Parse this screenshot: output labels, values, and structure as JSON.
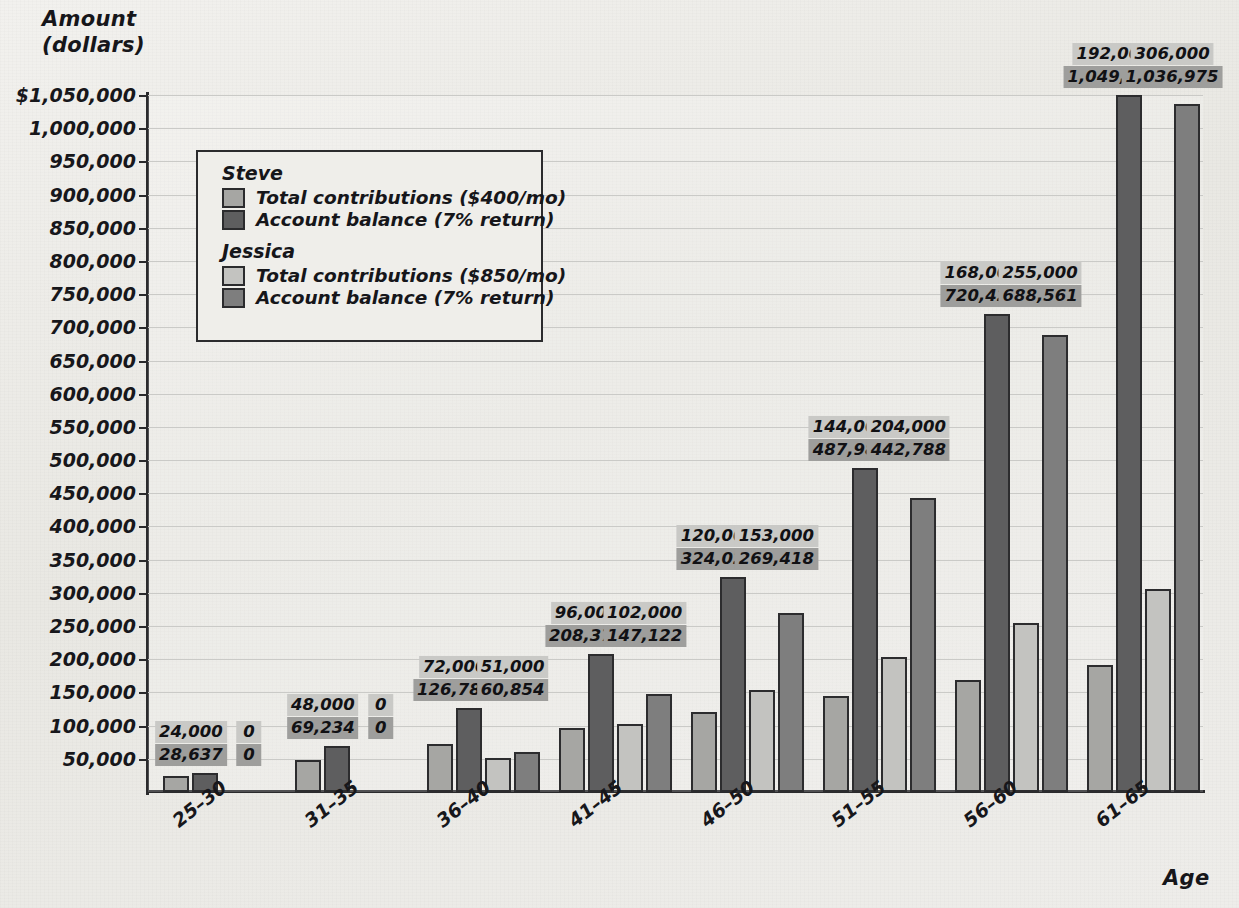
{
  "chart_data": {
    "type": "bar",
    "title": "",
    "xlabel": "Age",
    "ylabel": "Amount (dollars)",
    "ylabel_line1": "Amount",
    "ylabel_line2": "(dollars)",
    "ylim": [
      0,
      1050000
    ],
    "grid": true,
    "legend_position": "upper-left-inside",
    "categories": [
      "25–30",
      "31–35",
      "36–40",
      "41–45",
      "46–50",
      "51–55",
      "56–60",
      "61–65"
    ],
    "y_ticks": [
      "$1,050,000",
      "1,000,000",
      "950,000",
      "900,000",
      "850,000",
      "800,000",
      "750,000",
      "700,000",
      "650,000",
      "600,000",
      "550,000",
      "500,000",
      "450,000",
      "400,000",
      "350,000",
      "300,000",
      "250,000",
      "200,000",
      "150,000",
      "100,000",
      "50,000"
    ],
    "y_tick_values": [
      1050000,
      1000000,
      950000,
      900000,
      850000,
      800000,
      750000,
      700000,
      650000,
      600000,
      550000,
      500000,
      450000,
      400000,
      350000,
      300000,
      250000,
      200000,
      150000,
      100000,
      50000
    ],
    "series": [
      {
        "name": "Steve Total contributions ($400/mo)",
        "person": "Steve",
        "key": "s-contrib",
        "color": "#a6a6a3",
        "values": [
          24000,
          48000,
          72000,
          96000,
          120000,
          144000,
          168000,
          192000
        ],
        "labels": [
          "24,000",
          "48,000",
          "72,000",
          "96,000",
          "120,000",
          "144,000",
          "168,000",
          "192,000"
        ]
      },
      {
        "name": "Steve Account balance (7% return)",
        "person": "Steve",
        "key": "s-balance",
        "color": "#5e5e5f",
        "values": [
          28637,
          69234,
          126785,
          208371,
          324029,
          487988,
          720422,
          1049925
        ],
        "labels": [
          "28,637",
          "69,234",
          "126,785",
          "208,371",
          "324,029",
          "487,988",
          "720,422",
          "1,049,925"
        ]
      },
      {
        "name": "Jessica Total contributions ($850/mo)",
        "person": "Jessica",
        "key": "j-contrib",
        "color": "#c3c3c0",
        "values": [
          0,
          0,
          51000,
          102000,
          153000,
          204000,
          255000,
          306000
        ],
        "labels": [
          "0",
          "0",
          "51,000",
          "102,000",
          "153,000",
          "204,000",
          "255,000",
          "306,000"
        ]
      },
      {
        "name": "Jessica Account balance (7% return)",
        "person": "Jessica",
        "key": "j-balance",
        "color": "#7e7e7e",
        "values": [
          0,
          0,
          60854,
          147122,
          269418,
          442788,
          688561,
          1036975
        ],
        "labels": [
          "0",
          "0",
          "60,854",
          "147,122",
          "269,418",
          "442,788",
          "688,561",
          "1,036,975"
        ]
      }
    ]
  },
  "legend": {
    "groups": [
      {
        "title": "Steve",
        "rows": [
          {
            "key": "s-contrib",
            "label": "Total contributions ($400/mo)"
          },
          {
            "key": "s-balance",
            "label": "Account balance (7% return)"
          }
        ]
      },
      {
        "title": "Jessica",
        "rows": [
          {
            "key": "j-contrib",
            "label": "Total contributions ($850/mo)"
          },
          {
            "key": "j-balance",
            "label": "Account balance (7% return)"
          }
        ]
      }
    ]
  }
}
